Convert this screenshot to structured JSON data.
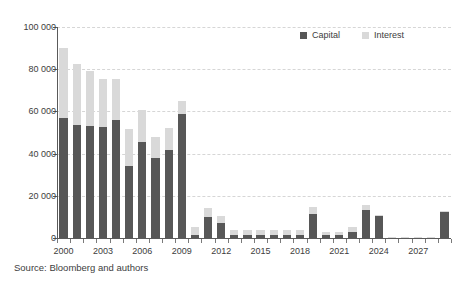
{
  "chart_data": {
    "type": "bar",
    "subtype": "stacked-bar",
    "title": "",
    "subtitle": "",
    "xlabel": "",
    "ylabel": "",
    "ylim": [
      0,
      100000
    ],
    "ytick_values": [
      0,
      20000,
      40000,
      60000,
      80000,
      100000
    ],
    "ytick_labels": [
      "0",
      "20 000",
      "40 000",
      "60 000",
      "80 000",
      "100 000"
    ],
    "grid": "horizontal-dashed",
    "legend_position": "top-right",
    "categories": [
      "2000",
      "2001",
      "2002",
      "2003",
      "2004",
      "2005",
      "2006",
      "2007",
      "2008",
      "2009",
      "2010",
      "2011",
      "2012",
      "2013",
      "2014",
      "2015",
      "2016",
      "2017",
      "2018",
      "2019",
      "2020",
      "2021",
      "2022",
      "2023",
      "2024",
      "2025",
      "2026",
      "2027",
      "2028",
      "2029"
    ],
    "xtick_labels": [
      "2000",
      "2003",
      "2006",
      "2009",
      "2012",
      "2015",
      "2018",
      "2021",
      "2024",
      "2027"
    ],
    "series": [
      {
        "name": "Capital",
        "color": "#575757",
        "values": [
          57000,
          53500,
          53000,
          52500,
          56000,
          34000,
          45500,
          38000,
          41500,
          59000,
          1500,
          10000,
          7000,
          1200,
          1200,
          1200,
          1200,
          1200,
          1200,
          11500,
          1200,
          1200,
          3000,
          13500,
          10500,
          300,
          300,
          300,
          300,
          12500
        ]
      },
      {
        "name": "Interest",
        "color": "#d9d9d9",
        "values": [
          33000,
          29000,
          26000,
          23000,
          19500,
          17500,
          15000,
          10000,
          10500,
          6000,
          3500,
          4000,
          3500,
          2800,
          2800,
          2800,
          2800,
          2800,
          2800,
          3000,
          1800,
          1800,
          2000,
          2000,
          500,
          200,
          200,
          200,
          200,
          400
        ]
      }
    ],
    "totals": [
      90000,
      82500,
      79000,
      75500,
      75500,
      51500,
      60500,
      48000,
      52000,
      65000,
      5000,
      14000,
      10500,
      4000,
      4000,
      4000,
      4000,
      4000,
      4000,
      14500,
      3000,
      3000,
      5000,
      15500,
      11000,
      500,
      500,
      500,
      500,
      12900
    ]
  },
  "legend": {
    "entries": [
      {
        "label": "Capital",
        "color": "#575757"
      },
      {
        "label": "Interest",
        "color": "#d9d9d9"
      }
    ]
  },
  "source": {
    "text": "Source: Bloomberg and authors"
  }
}
